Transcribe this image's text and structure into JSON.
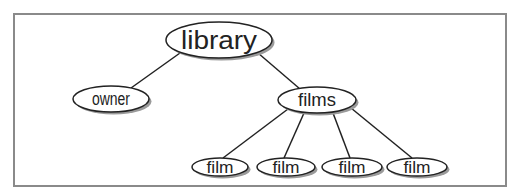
{
  "diagram": {
    "type": "tree",
    "nodes": [
      {
        "id": "library",
        "label": "library",
        "cx": 219,
        "cy": 40,
        "rx": 53,
        "ry": 18,
        "font": 26
      },
      {
        "id": "owner",
        "label": "owner",
        "cx": 111,
        "cy": 99,
        "rx": 38,
        "ry": 13,
        "font": 18
      },
      {
        "id": "films",
        "label": "films",
        "cx": 317,
        "cy": 100,
        "rx": 39,
        "ry": 13,
        "font": 18
      },
      {
        "id": "film1",
        "label": "film",
        "cx": 220,
        "cy": 167,
        "rx": 28,
        "ry": 9,
        "font": 16
      },
      {
        "id": "film2",
        "label": "film",
        "cx": 286,
        "cy": 167,
        "rx": 29,
        "ry": 9,
        "font": 16
      },
      {
        "id": "film3",
        "label": "film",
        "cx": 352,
        "cy": 167,
        "rx": 30,
        "ry": 9,
        "font": 16
      },
      {
        "id": "film4",
        "label": "film",
        "cx": 417,
        "cy": 167,
        "rx": 30,
        "ry": 9,
        "font": 16
      }
    ],
    "edges": [
      {
        "from": "library",
        "to": "owner",
        "x1": 180,
        "y1": 53,
        "x2": 131,
        "y2": 88
      },
      {
        "from": "library",
        "to": "films",
        "x1": 258,
        "y1": 53,
        "x2": 300,
        "y2": 89
      },
      {
        "from": "films",
        "to": "film1",
        "x1": 288,
        "y1": 109,
        "x2": 223,
        "y2": 158
      },
      {
        "from": "films",
        "to": "film2",
        "x1": 304,
        "y1": 113,
        "x2": 284,
        "y2": 158
      },
      {
        "from": "films",
        "to": "film3",
        "x1": 333,
        "y1": 113,
        "x2": 350,
        "y2": 158
      },
      {
        "from": "films",
        "to": "film4",
        "x1": 351,
        "y1": 108,
        "x2": 412,
        "y2": 158
      }
    ],
    "colors": {
      "stroke": "#222222",
      "shadow": "#9a9a9a",
      "border": "#8a8a8a"
    }
  }
}
